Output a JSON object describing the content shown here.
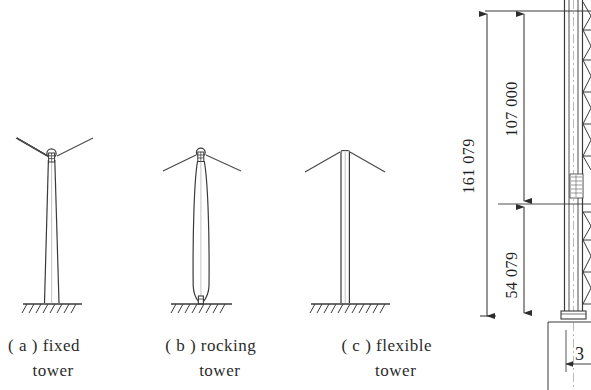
{
  "figure": {
    "title_visible": false,
    "background_color": "#ffffff",
    "line_color": "#3a3a3a",
    "towers": [
      {
        "id": "tower-a",
        "tag": "( a )",
        "name_line1": "fixed",
        "name_line2": "tower",
        "caption": "( a ) fixed tower",
        "base_type": "fixed",
        "shaft_shape": "tapered",
        "has_saddle": true,
        "has_stay_cables": true
      },
      {
        "id": "tower-b",
        "tag": "( b )",
        "name_line1": "rocking",
        "name_line2": "tower",
        "caption": "( b ) rocking tower",
        "base_type": "pinned-rocker",
        "shaft_shape": "spindle",
        "has_saddle": true,
        "has_stay_cables": true
      },
      {
        "id": "tower-c",
        "tag": "( c )",
        "name_line1": "flexible",
        "name_line2": "tower",
        "caption": "( c ) flexible tower",
        "base_type": "fixed",
        "shaft_shape": "uniform-slender",
        "has_saddle": false,
        "has_stay_cables": true
      }
    ],
    "elevation_drawing": {
      "description": "lattice steel tower elevation with X-bracing, partially cropped at right edge",
      "dimensions": [
        {
          "id": "overall-height",
          "label": "161 079",
          "orientation": "vertical",
          "position": "outer-left"
        },
        {
          "id": "upper-segment",
          "label": "107 000",
          "orientation": "vertical",
          "position": "inner-upper"
        },
        {
          "id": "lower-segment",
          "label": "54 079",
          "orientation": "vertical",
          "position": "inner-lower"
        },
        {
          "id": "base-offset",
          "label": "3",
          "orientation": "horizontal",
          "position": "bottom-right"
        }
      ]
    }
  }
}
